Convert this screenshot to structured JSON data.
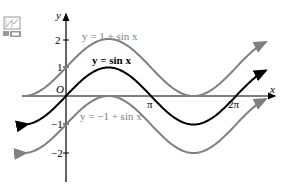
{
  "icon": {
    "name": "graph-icon"
  },
  "chart_data": {
    "type": "line",
    "title": "",
    "xlabel": "x",
    "ylabel": "y",
    "x_ticks": [
      "π",
      "2π"
    ],
    "y_ticks": [
      "2",
      "1",
      "-1",
      "-2"
    ],
    "origin_label": "O",
    "series": [
      {
        "name": "y = 1 + sin x",
        "shift": 1,
        "color": "#808080"
      },
      {
        "name": "y = sin x",
        "shift": 0,
        "color": "#000000"
      },
      {
        "name": "y = −1 + sin x",
        "shift": -1,
        "color": "#808080"
      }
    ],
    "xlim": [
      -0.5,
      2.4
    ],
    "ylim": [
      -2.5,
      2.3
    ]
  },
  "labels": {
    "axis_x": "x",
    "axis_y": "y",
    "origin": "O",
    "tick_pi": "π",
    "tick_2pi": "2π",
    "tick_2": "2",
    "tick_1": "1",
    "tick_m1": "−1",
    "tick_m2": "−2",
    "curve_top": "y = 1 + sin x",
    "curve_mid": "y = sin x",
    "curve_bot": "y = −1 + sin x"
  }
}
